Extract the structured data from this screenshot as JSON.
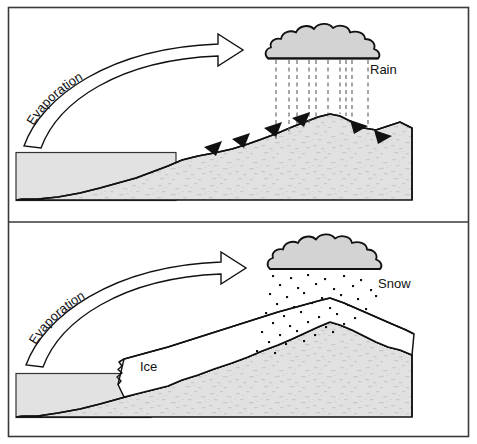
{
  "diagram": {
    "background_color": "#ffffff",
    "frame_color": "#3a3a3a",
    "terrain_fill": "#e0e0e0",
    "cloud_fill": "#d3d3d3",
    "water_fill": "#e2e2e2",
    "ice_fill": "#ffffff",
    "line_color": "#111111"
  },
  "panels": [
    {
      "id": "rain-panel",
      "name": "Rain panel",
      "precipitation_label": "Rain",
      "evaporation_label": "Evaporation",
      "precipitation_style": "dashed vertical lines",
      "runoff_arrow_count": 6,
      "has_ice": false
    },
    {
      "id": "snow-panel",
      "name": "Snow panel",
      "precipitation_label": "Snow",
      "evaporation_label": "Evaporation",
      "precipitation_style": "scattered dots",
      "ice_label": "Ice",
      "runoff_arrow_count": 0,
      "has_ice": true
    }
  ],
  "labels": {
    "rain": "Rain",
    "snow": "Snow",
    "ice": "Ice",
    "evaporation_top": "Evaporation",
    "evaporation_bottom": "Evaporation"
  },
  "icon_names": {
    "cloud": "cloud-icon",
    "rain": "rain-icon",
    "snow": "snow-icon",
    "arrow": "curved-arrow-icon",
    "runoff": "runoff-arrow-icon",
    "mountain": "mountain-icon",
    "sea": "sea-icon",
    "glacier": "glacier-icon"
  }
}
